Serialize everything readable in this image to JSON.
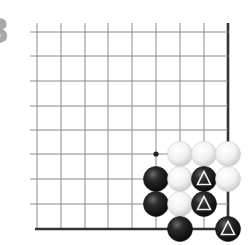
{
  "problem": {
    "number_fragment": "3"
  },
  "board": {
    "cols": 9,
    "rows": 9,
    "col_x": [
      37,
      61,
      85,
      108,
      132,
      156,
      180,
      204,
      228
    ],
    "row_y": [
      32,
      56,
      81,
      106,
      130,
      154,
      179,
      204,
      229
    ],
    "open_edges": [
      "top",
      "left"
    ],
    "closed_edges": [
      "right",
      "bottom"
    ],
    "line_color": "#8a8a8a",
    "border_color": "#333333",
    "stone_radius": 12.5
  },
  "marks": [
    {
      "type": "dot",
      "col": 5,
      "row": 5,
      "color": "#222222"
    }
  ],
  "stones": [
    {
      "color": "white",
      "col": 6,
      "row": 5,
      "marker": null
    },
    {
      "color": "white",
      "col": 7,
      "row": 5,
      "marker": null
    },
    {
      "color": "white",
      "col": 8,
      "row": 5,
      "marker": null
    },
    {
      "color": "black",
      "col": 5,
      "row": 6,
      "marker": null
    },
    {
      "color": "white",
      "col": 6,
      "row": 6,
      "marker": null
    },
    {
      "color": "black",
      "col": 7,
      "row": 6,
      "marker": "triangle"
    },
    {
      "color": "white",
      "col": 8,
      "row": 6,
      "marker": null
    },
    {
      "color": "black",
      "col": 5,
      "row": 7,
      "marker": null
    },
    {
      "color": "white",
      "col": 6,
      "row": 7,
      "marker": null
    },
    {
      "color": "black",
      "col": 7,
      "row": 7,
      "marker": "triangle"
    },
    {
      "color": "black",
      "col": 6,
      "row": 8,
      "marker": null
    },
    {
      "color": "black",
      "col": 8,
      "row": 8,
      "marker": "triangle"
    }
  ]
}
